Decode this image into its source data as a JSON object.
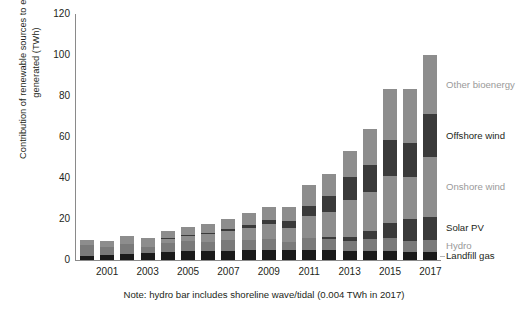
{
  "axis": {
    "y_title": "Contribution of renewable sources to electricity\ngenerated (TWh)",
    "y_ticks": [
      "0",
      "20",
      "40",
      "60",
      "80",
      "100",
      "120"
    ],
    "x_ticks": [
      "2001",
      "2003",
      "2005",
      "2007",
      "2009",
      "2011",
      "2013",
      "2015",
      "2017"
    ]
  },
  "note": "Note: hydro bar includes shoreline wave/tidal (0.004 TWh in 2017)",
  "legend": {
    "items": [
      {
        "label": "Other bioenergy",
        "color": "#8d8d8d",
        "tone": "light"
      },
      {
        "label": "Offshore wind",
        "color": "#3a3a3a",
        "tone": "dark"
      },
      {
        "label": "Onshore wind",
        "color": "#8d8d8d",
        "tone": "light"
      },
      {
        "label": "Solar PV",
        "color": "#3a3a3a",
        "tone": "dark"
      },
      {
        "label": "Hydro",
        "color": "#7a7a7a",
        "tone": "light"
      },
      {
        "label": "Landfill gas",
        "color": "#1a1a1a",
        "tone": "dark"
      }
    ]
  },
  "chart_data": {
    "type": "bar",
    "stacked": true,
    "title": "",
    "xlabel": "",
    "ylabel": "Contribution of renewable sources to electricity generated (TWh)",
    "ylim": [
      0,
      120
    ],
    "grid": false,
    "legend_position": "right-inline",
    "categories": [
      "2000",
      "2001",
      "2002",
      "2003",
      "2004",
      "2005",
      "2006",
      "2007",
      "2008",
      "2009",
      "2010",
      "2011",
      "2012",
      "2013",
      "2014",
      "2015",
      "2016",
      "2017"
    ],
    "series": [
      {
        "name": "Landfill gas",
        "color": "#1a1a1a",
        "values": [
          2.0,
          2.4,
          2.8,
          3.2,
          3.7,
          4.2,
          4.4,
          4.6,
          4.8,
          5.0,
          5.0,
          4.9,
          4.8,
          4.6,
          4.4,
          4.2,
          4.0,
          3.8
        ]
      },
      {
        "name": "Hydro",
        "color": "#7a7a7a",
        "values": [
          5.1,
          4.1,
          4.8,
          3.2,
          4.8,
          4.9,
          4.6,
          5.1,
          5.1,
          5.2,
          3.6,
          5.7,
          5.3,
          4.7,
          5.9,
          6.3,
          5.4,
          5.9
        ]
      },
      {
        "name": "Solar PV",
        "color": "#3a3a3a",
        "values": [
          0.0,
          0.0,
          0.0,
          0.0,
          0.0,
          0.0,
          0.0,
          0.0,
          0.0,
          0.0,
          0.0,
          0.2,
          1.3,
          2.0,
          4.1,
          7.6,
          10.4,
          11.5
        ]
      },
      {
        "name": "Onshore wind",
        "color": "#8d8d8d",
        "values": [
          0.9,
          1.0,
          1.3,
          1.6,
          2.0,
          2.5,
          3.6,
          4.5,
          5.8,
          7.6,
          7.2,
          10.5,
          12.2,
          17.9,
          18.6,
          22.9,
          20.9,
          29.0
        ]
      },
      {
        "name": "Offshore wind",
        "color": "#3a3a3a",
        "values": [
          0.0,
          0.0,
          0.0,
          0.0,
          0.2,
          0.4,
          0.7,
          0.8,
          1.3,
          1.7,
          3.1,
          5.1,
          7.6,
          11.5,
          13.4,
          17.4,
          16.4,
          20.9
        ]
      },
      {
        "name": "Other bioenergy",
        "color": "#8d8d8d",
        "values": [
          2.0,
          2.0,
          2.6,
          3.0,
          3.6,
          4.2,
          4.5,
          5.0,
          5.8,
          6.2,
          6.9,
          10.4,
          10.9,
          12.6,
          17.7,
          24.9,
          26.2,
          29.0
        ]
      }
    ]
  }
}
